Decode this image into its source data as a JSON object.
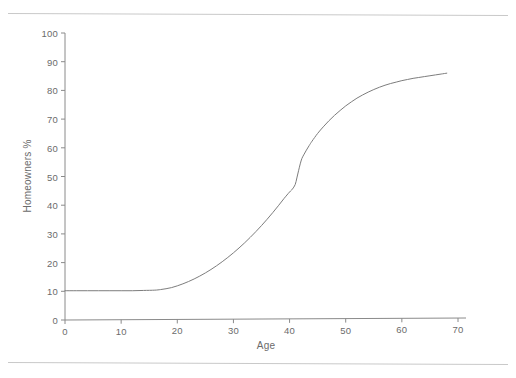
{
  "figure": {
    "background_color": "#ffffff",
    "rule_color": "#c9c9c9",
    "axis_color": "#8a8a8a",
    "curve_color": "#7d7d7d",
    "text_color": "#6b6b6b"
  },
  "chart_data": {
    "type": "line",
    "title": "",
    "subtitle": "",
    "xlabel": "Age",
    "ylabel": "Homeowners %",
    "xlim": [
      0,
      70
    ],
    "ylim": [
      0,
      100
    ],
    "xticks": [
      0,
      10,
      20,
      30,
      40,
      50,
      60,
      70
    ],
    "xtick_labels": [
      "0",
      "10",
      "20",
      "30",
      "40",
      "50",
      "60",
      "70"
    ],
    "yticks": [
      0,
      10,
      20,
      30,
      40,
      50,
      60,
      70,
      80,
      90,
      100
    ],
    "ytick_labels": [
      "0",
      "10",
      "20",
      "30",
      "40",
      "50",
      "60",
      "70",
      "80",
      "90",
      "100"
    ],
    "grid": false,
    "legend": false,
    "legend_position": "none",
    "annotations": [],
    "series": [
      {
        "name": "Homeowners %",
        "color": "#7d7d7d",
        "line_width": 1,
        "marker": "none",
        "x": [
          0,
          2,
          4,
          6,
          8,
          10,
          12,
          14,
          16,
          17,
          18,
          19,
          20,
          21,
          22,
          23,
          24,
          25,
          26,
          27,
          28,
          29,
          30,
          31,
          32,
          33,
          34,
          35,
          36,
          37,
          38,
          39,
          40,
          40.5,
          41,
          41.3,
          41.6,
          41.9,
          42.2,
          42.6,
          43,
          43.5,
          44,
          45,
          46,
          47,
          48,
          49,
          50,
          51,
          52,
          53,
          54,
          55,
          56,
          57,
          58,
          59,
          60,
          61,
          62,
          63,
          64,
          65,
          66,
          67,
          68
        ],
        "y": [
          10.2,
          10.2,
          10.2,
          10.2,
          10.2,
          10.2,
          10.2,
          10.3,
          10.4,
          10.6,
          10.9,
          11.3,
          11.9,
          12.6,
          13.4,
          14.3,
          15.3,
          16.4,
          17.6,
          18.9,
          20.3,
          21.8,
          23.4,
          25.1,
          26.9,
          28.8,
          30.8,
          32.9,
          35.1,
          37.4,
          39.8,
          42.3,
          44.6,
          45.6,
          47.2,
          49.5,
          52.0,
          54.4,
          56.3,
          57.8,
          59.2,
          60.8,
          62.3,
          65.0,
          67.3,
          69.4,
          71.3,
          73.0,
          74.6,
          76.0,
          77.3,
          78.4,
          79.4,
          80.3,
          81.1,
          81.8,
          82.4,
          82.9,
          83.4,
          83.8,
          84.2,
          84.5,
          84.8,
          85.1,
          85.4,
          85.7,
          86.0
        ]
      }
    ]
  }
}
